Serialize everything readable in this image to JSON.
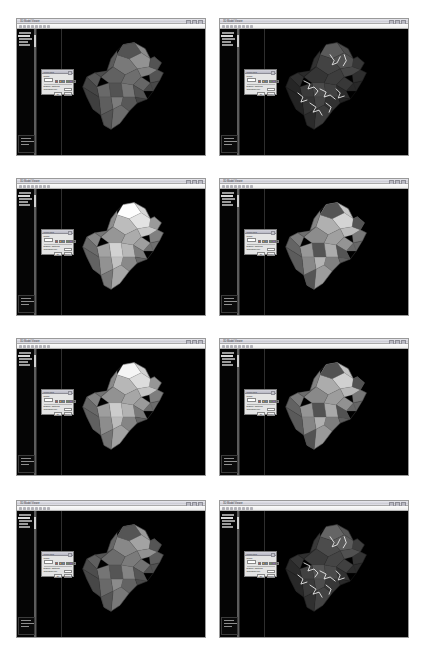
{
  "figure": {
    "caption": "",
    "rows": 4,
    "cols": 2,
    "panel_count": 8
  },
  "window": {
    "title": "3D Model Viewer",
    "titlebar_buttons": [
      "minimize",
      "maximize",
      "close"
    ],
    "toolbar_icons": [
      "open-icon",
      "save-icon",
      "undo-icon",
      "redo-icon",
      "zoom-icon",
      "rotate-icon",
      "pan-icon",
      "measure-icon"
    ]
  },
  "sidebar": {
    "tree_items": [
      "Project",
      "Model",
      "Surfaces",
      "Blocks",
      "Views"
    ],
    "selected_item": "Model",
    "bottom_panel_rows": [
      "Property",
      "Value",
      "Units"
    ]
  },
  "dialog": {
    "title": "Properties",
    "field_label": "Name",
    "field_value": "",
    "color_label": "Color",
    "row_label": "Display Options",
    "slider_label": "Transparency",
    "ok_label": "OK",
    "cancel_label": "Cancel",
    "swatches": [
      "#c8504a",
      "#d8a040",
      "#5a8fc0",
      "#6aa05a",
      "#8a6ab0",
      "#4a4a4a"
    ]
  },
  "viewport": {
    "background": "#000000"
  },
  "panels": [
    {
      "id": "panel-1",
      "row": 1,
      "col": 1,
      "render_mode": "shaded-grey",
      "model_tone": "#8a8a8a",
      "has_fracture_lines": false,
      "has_patches": true
    },
    {
      "id": "panel-2",
      "row": 1,
      "col": 2,
      "render_mode": "dark-with-fractures",
      "model_tone": "#4c4c4c",
      "has_fracture_lines": true,
      "has_patches": false
    },
    {
      "id": "panel-3",
      "row": 2,
      "col": 1,
      "render_mode": "bright-shaded",
      "model_tone": "#d6d6d6",
      "has_fracture_lines": false,
      "has_patches": false
    },
    {
      "id": "panel-4",
      "row": 2,
      "col": 2,
      "render_mode": "light-with-dark-patches",
      "model_tone": "#c8c8c8",
      "has_fracture_lines": false,
      "has_patches": true
    },
    {
      "id": "panel-5",
      "row": 3,
      "col": 1,
      "render_mode": "bright-shaded",
      "model_tone": "#d0d0d0",
      "has_fracture_lines": false,
      "has_patches": false
    },
    {
      "id": "panel-6",
      "row": 3,
      "col": 2,
      "render_mode": "light-with-dark-patches",
      "model_tone": "#c4c4c4",
      "has_fracture_lines": false,
      "has_patches": true
    },
    {
      "id": "panel-7",
      "row": 4,
      "col": 1,
      "render_mode": "mid-grey-patches",
      "model_tone": "#9a9a9a",
      "has_fracture_lines": false,
      "has_patches": true
    },
    {
      "id": "panel-8",
      "row": 4,
      "col": 2,
      "render_mode": "dark-with-fractures",
      "model_tone": "#565656",
      "has_fracture_lines": true,
      "has_patches": false
    }
  ]
}
